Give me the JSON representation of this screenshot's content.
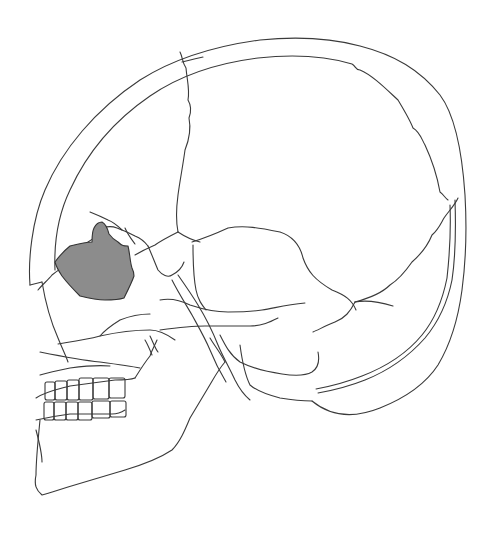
{
  "figure": {
    "background": "#ffffff",
    "stroke_color": "#3a3a3a",
    "highlight_color": "#8c8c8c",
    "highlighted_region": "orbit-region"
  },
  "paths": {
    "cranium_outer": "M30,285 C28,260 32,220 45,190 C62,150 95,110 140,80 C175,58 215,46 260,40 C300,36 330,38 360,46 C395,55 420,70 440,95 C455,115 462,150 465,195 C467,230 466,260 462,290 C458,320 450,345 438,365 C425,385 405,398 380,408 C360,416 335,420 312,401",
    "cranium_inner": "M55,270 C54,245 58,215 70,190 C86,155 112,122 150,96 C182,74 218,63 258,58 C295,54 325,56 352,64 C356,66 355,70 360,70 C372,75 385,88 398,100 C404,110 410,120 413,128 C420,132 422,140 425,145 C432,160 437,175 440,192 C444,195 445,198 448,200",
    "inner_table_posterior": "M455,200 C456,230 455,260 452,280 C448,300 440,320 425,338 C410,355 390,370 365,380 C350,386 335,390 318,393",
    "inner_table_posterior2": "M450,205 C451,230 449,260 447,278 C443,298 436,318 422,335 C408,352 388,366 362,376 C347,382 332,386 316,389",
    "coronal_suture": "M180,52 C183,58 182,62 186,68 C187,80 190,90 188,100 C191,105 192,110 189,118 C191,128 189,140 185,150 C183,165 180,180 178,195 C176,210 176,222 178,232",
    "frontal_line": "M182,62 C190,60 198,58 203,57",
    "lambdoid_suture": "M458,198 C455,205 448,212 444,218 C440,225 438,230 432,235 C428,245 420,255 412,262 C405,272 398,280 390,285 C383,292 370,298 355,302",
    "squamous_suture": "M192,242 C205,238 215,234 228,228 C245,225 260,228 280,232 C292,236 300,245 303,258 C308,272 315,280 332,290 C345,295 352,300 356,310",
    "temporal_line": "M355,302 C365,300 380,302 393,306",
    "occipital_lower": "M355,302 C350,312 345,318 335,322 C325,326 318,330 313,332",
    "sphenoid_frontal": "M178,232 C170,236 162,240 155,245 C148,248 140,252 135,255",
    "sphenoid_parietal": "M178,232 C184,236 192,240 200,242",
    "temporal_squama_edge": "M193,245 C193,260 193,275 196,290 C198,300 202,305 206,310",
    "zygomatic_arch": "M160,300 C170,298 180,300 190,305 C205,310 215,312 228,312 C240,312 250,312 262,310 C275,308 285,305 305,303",
    "zygomatic_lower": "M160,330 C175,328 190,326 205,326 C220,326 235,326 250,326 C262,326 270,322 278,318",
    "mastoid_region": "M220,335 C225,345 230,355 240,362 C252,368 268,372 282,374 C295,376 305,376 312,372 C318,368 320,362 318,352",
    "mastoid_outline": "M240,345 C242,360 245,375 250,385 C258,392 268,395 280,398 C292,400 302,401 312,401",
    "styloid_region": "M178,275 C185,285 192,295 198,305 C206,318 212,330 218,345 C222,355 228,365 235,380 C240,390 244,395 250,400",
    "styloid_inner": "M172,280 C178,292 185,303 192,315 C198,326 205,338 210,350 C214,360 220,372 226,382",
    "frontal_process": "M38,290 C42,285 48,280 52,275 C58,270 62,268 65,266",
    "nasal_bone": "M30,285 C34,284 38,283 42,282",
    "maxilla_front": "M42,282 C45,300 50,320 58,338 C62,348 66,356 68,362",
    "orbit_top": "M88,242 C95,238 100,232 103,228 C108,226 112,226 117,228 C122,230 128,232 135,236 C140,238 145,242 148,246",
    "orbit_rim_back": "M148,246 C152,255 155,263 158,270 C162,275 168,278 172,275 C178,272 182,268 184,262",
    "ethmoid_region": "M90,212 C95,214 100,216 108,220 C113,222 118,226 122,230",
    "lacrimal": "M125,228 C128,235 132,240 135,244",
    "palate": "M58,344 C70,342 85,340 100,336 C118,332 135,330 150,330 C160,330 168,335 175,340",
    "palate_lower": "M40,352 C60,356 80,360 100,362 C115,364 130,366 140,368",
    "upper_teeth_line": "M36,398 C45,392 55,390 70,386 C85,384 100,382 115,380 C125,380 130,380 135,378",
    "lower_teeth_line": "M36,420 C45,418 55,416 70,414 C85,414 100,414 112,414 C118,414 122,412 125,410",
    "mandible_outline": "M40,420 C38,440 36,460 36,475 C34,485 36,490 42,495 C50,493 58,490 68,487 C85,482 105,476 125,470 C145,464 160,458 172,450 C180,442 185,430 190,418 C196,408 202,398 208,388 C214,378 218,370 225,362",
    "mandible_ramus": "M225,362 C220,352 214,345 210,338",
    "mandible_chin_inner": "M36,430 C40,445 42,455 42,462",
    "maxilla_lower_border": "M135,378 C140,370 145,362 150,356 C152,350 155,345 157,340",
    "maxilla_teeth_root": "M40,375 C50,372 60,370 70,368 C85,366 100,365 110,366",
    "pterygoid_1": "M145,340 C148,345 150,350 152,355",
    "pterygoid_2": "M150,336 C153,342 155,348 158,352",
    "cheek_inner": "M100,336 C105,330 112,325 120,320 C130,316 140,314 150,314"
  },
  "shaded_region": {
    "path": "M55,262 C60,255 65,250 70,246 C78,244 86,242 92,242 C92,236 92,232 94,228 C96,224 98,222 102,222 C106,224 108,230 109,234 C112,238 114,240 118,242 C122,246 124,246 128,246 C130,254 130,262 132,268 C134,272 134,274 134,276 C132,282 128,290 124,298 C118,300 112,300 105,300 C96,300 88,298 80,296 C74,290 68,284 62,276 C58,270 56,266 55,262 Z"
  },
  "teeth": {
    "upper": [
      {
        "x": 45,
        "y": 382,
        "w": 10,
        "h": 18
      },
      {
        "x": 55,
        "y": 381,
        "w": 12,
        "h": 19
      },
      {
        "x": 67,
        "y": 380,
        "w": 12,
        "h": 20
      },
      {
        "x": 79,
        "y": 378,
        "w": 14,
        "h": 22
      },
      {
        "x": 93,
        "y": 378,
        "w": 16,
        "h": 21
      },
      {
        "x": 109,
        "y": 378,
        "w": 16,
        "h": 20
      }
    ],
    "lower": [
      {
        "x": 44,
        "y": 402,
        "w": 10,
        "h": 18
      },
      {
        "x": 54,
        "y": 402,
        "w": 12,
        "h": 18
      },
      {
        "x": 66,
        "y": 402,
        "w": 12,
        "h": 18
      },
      {
        "x": 78,
        "y": 402,
        "w": 14,
        "h": 18
      },
      {
        "x": 92,
        "y": 401,
        "w": 18,
        "h": 17
      },
      {
        "x": 110,
        "y": 401,
        "w": 16,
        "h": 16
      }
    ]
  }
}
